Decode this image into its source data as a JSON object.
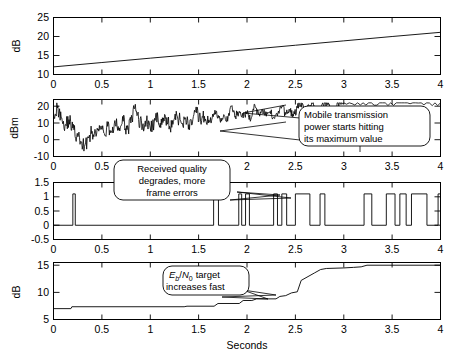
{
  "figure": {
    "title": "",
    "xlabel": "Seconds",
    "background": "#ffffff",
    "line_color": "#000000"
  },
  "annotations": [
    {
      "id": "max-power",
      "lines": [
        "Mobile transmission",
        "power starts hitting",
        "its maximum value"
      ],
      "panel": 2
    },
    {
      "id": "frame-errors",
      "lines": [
        "Received quality",
        "degrades, more",
        "frame errors"
      ],
      "panel": 3
    },
    {
      "id": "ebn0-target",
      "lines": [
        "E_b/N_0 target",
        "increases fast"
      ],
      "rich": {
        "l1_a": "E",
        "l1_b": "b",
        "l1_c": "/",
        "l1_d": "N",
        "l1_e": "0",
        "l1_f": "target",
        "l2": "increases fast"
      },
      "panel": 4
    }
  ],
  "chart_data": [
    {
      "type": "line",
      "panel": 1,
      "title": "",
      "xlabel": "",
      "ylabel": "dB",
      "xlim": [
        0,
        4
      ],
      "ylim": [
        10,
        25
      ],
      "xticks": [
        0,
        0.5,
        1,
        1.5,
        2,
        2.5,
        3,
        3.5,
        4
      ],
      "xticklabels": [
        "0",
        "0.5",
        "1",
        "1.5",
        "2",
        "2.5",
        "3",
        "3.5",
        "4"
      ],
      "yticks": [
        10,
        15,
        20,
        25
      ],
      "yticklabels": [
        "10",
        "15",
        "20",
        "25"
      ],
      "grid": false,
      "legend": "none",
      "description": "Linearly increasing path loss / distance attenuation ramp",
      "x": [
        0,
        0.5,
        1,
        1.5,
        2,
        2.5,
        3,
        3.5,
        4
      ],
      "values": [
        12.0,
        13.15,
        14.3,
        15.4,
        16.55,
        17.7,
        18.85,
        20.0,
        21.1
      ]
    },
    {
      "type": "line",
      "panel": 2,
      "title": "",
      "xlabel": "",
      "ylabel": "dBm",
      "xlim": [
        0,
        4
      ],
      "ylim": [
        -10,
        24
      ],
      "xticks": [
        0,
        0.5,
        1,
        1.5,
        2,
        2.5,
        3,
        3.5,
        4
      ],
      "xticklabels": [
        "0",
        "0.5",
        "1",
        "1.5",
        "2",
        "2.5",
        "3",
        "3.5",
        "4"
      ],
      "yticks": [
        -10,
        0,
        10,
        20
      ],
      "yticklabels": [
        "-10",
        "0",
        "10",
        "20"
      ],
      "grid": false,
      "legend": "none",
      "saturation_level": 22,
      "description": "Mobile transmit power, fast-fading compensation; saturates at 22 dBm after ~1.6 s",
      "x": [
        0,
        0.04,
        0.08,
        0.12,
        0.16,
        0.2,
        0.24,
        0.28,
        0.32,
        0.36,
        0.4,
        0.44,
        0.48,
        0.52,
        0.56,
        0.6,
        0.64,
        0.68,
        0.72,
        0.76,
        0.8,
        0.84,
        0.88,
        0.92,
        0.96,
        1,
        1.04,
        1.08,
        1.12,
        1.16,
        1.2,
        1.24,
        1.28,
        1.32,
        1.36,
        1.4,
        1.44,
        1.48,
        1.52,
        1.56,
        1.6,
        1.64,
        1.68,
        1.72,
        1.76,
        1.8,
        1.84,
        1.88,
        1.92,
        1.96,
        2,
        2.04,
        2.08,
        2.12,
        2.16,
        2.2,
        2.24,
        2.28,
        2.32,
        2.36,
        2.4,
        2.44,
        2.48,
        2.52,
        2.56,
        2.6,
        2.64,
        2.68,
        2.72,
        2.76,
        2.8,
        2.84,
        2.88,
        2.92,
        2.96,
        3,
        3.2,
        3.4,
        3.6,
        3.8,
        4
      ],
      "values": [
        16,
        19,
        13,
        9,
        12,
        7,
        2,
        -1,
        -4,
        1,
        5,
        2,
        6,
        4,
        8,
        5,
        9,
        7,
        11,
        6,
        10,
        19,
        12,
        8,
        11,
        7,
        10,
        13,
        9,
        12,
        8,
        11,
        14,
        10,
        13,
        9,
        12,
        16,
        11,
        14,
        10,
        13,
        17,
        12,
        15,
        11,
        20,
        14,
        17,
        13,
        16,
        12,
        21,
        15,
        18,
        14,
        17,
        13,
        16,
        20,
        15,
        18,
        14,
        19,
        22,
        16,
        20,
        22,
        14,
        18,
        22,
        22,
        16,
        20,
        22,
        22,
        22,
        22,
        22,
        22,
        22
      ]
    },
    {
      "type": "line",
      "panel": 3,
      "title": "",
      "xlabel": "",
      "ylabel": "",
      "xlim": [
        0,
        4
      ],
      "ylim": [
        -0.5,
        1.5
      ],
      "xticks": [
        0,
        0.5,
        1,
        1.5,
        2,
        2.5,
        3,
        3.5,
        4
      ],
      "xticklabels": [
        "0",
        "0.5",
        "1",
        "1.5",
        "2",
        "2.5",
        "3",
        "3.5",
        "4"
      ],
      "yticks": [
        -0.5,
        0,
        0.5,
        1,
        1.5
      ],
      "yticklabels": [
        "-0.5",
        "0",
        "0.5",
        "1",
        "1.5"
      ],
      "grid": false,
      "legend": "none",
      "description": "Binary frame-error indicator (0 = good frame, 1 = frame error); errors become frequent after 1.6 s",
      "pulses": [
        [
          0.2,
          0.225
        ],
        [
          1.655,
          1.705
        ],
        [
          1.915,
          1.945
        ],
        [
          1.985,
          2.025
        ],
        [
          2.275,
          2.315
        ],
        [
          2.36,
          2.41
        ],
        [
          2.5,
          2.65
        ],
        [
          2.755,
          2.805
        ],
        [
          3.21,
          3.29
        ],
        [
          3.44,
          3.53
        ],
        [
          3.58,
          3.645
        ],
        [
          3.7,
          3.86
        ],
        [
          3.975,
          4.0
        ]
      ]
    },
    {
      "type": "line",
      "panel": 4,
      "title": "",
      "xlabel": "Seconds",
      "ylabel": "dB",
      "xlim": [
        0,
        4
      ],
      "ylim": [
        5,
        15.5
      ],
      "xticks": [
        0,
        0.5,
        1,
        1.5,
        2,
        2.5,
        3,
        3.5,
        4
      ],
      "xticklabels": [
        "0",
        "0.5",
        "1",
        "1.5",
        "2",
        "2.5",
        "3",
        "3.5",
        "4"
      ],
      "yticks": [
        5,
        10,
        15
      ],
      "yticklabels": [
        "5",
        "10",
        "15"
      ],
      "grid": false,
      "legend": "none",
      "description": "Outer-loop Eb/N0 target, stepping up as frame errors accumulate; clipped at 15 dB",
      "x": [
        0,
        0.18,
        0.19,
        1.35,
        1.38,
        1.66,
        1.7,
        1.92,
        1.96,
        2.05,
        2.1,
        2.3,
        2.34,
        2.4,
        2.46,
        2.52,
        2.56,
        2.7,
        2.76,
        2.82,
        3.0,
        3.1,
        3.18,
        3.24,
        4.0
      ],
      "values": [
        7.0,
        7.0,
        7.35,
        7.35,
        7.45,
        7.45,
        7.95,
        7.95,
        8.5,
        8.5,
        8.8,
        8.8,
        9.25,
        9.4,
        9.9,
        10.1,
        12.2,
        13.6,
        14.2,
        14.4,
        14.5,
        14.6,
        14.7,
        15.0,
        15.0
      ]
    }
  ]
}
